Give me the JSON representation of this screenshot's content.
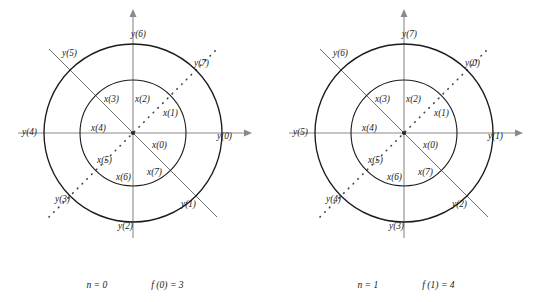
{
  "figure": {
    "background_color": "#ffffff",
    "stroke_color": "#1b1b1b",
    "axis_color": "#8a8a8a",
    "diagonal_solid_color": "#6f6f6f",
    "diagonal_dotted_color": "#4a4a4a"
  },
  "diagrams": [
    {
      "id": "left",
      "caption": {
        "n": "n = 0",
        "f": "f (0) = 3"
      },
      "outer_labels": [
        {
          "text": "y(0)",
          "angle_deg": 0,
          "x": 217,
          "y": 132
        },
        {
          "text": "y(1)",
          "angle_deg": 315,
          "x": 181,
          "y": 200
        },
        {
          "text": "y(2)",
          "angle_deg": 270,
          "x": 118,
          "y": 222
        },
        {
          "text": "y(3)",
          "angle_deg": 225,
          "x": 55,
          "y": 195
        },
        {
          "text": "y(4)",
          "angle_deg": 180,
          "x": 22,
          "y": 128
        },
        {
          "text": "y(5)",
          "angle_deg": 135,
          "x": 62,
          "y": 49
        },
        {
          "text": "y(6)",
          "angle_deg": 90,
          "x": 131,
          "y": 30
        },
        {
          "text": "y(7)",
          "angle_deg": 45,
          "x": 194,
          "y": 59
        }
      ],
      "inner_labels": [
        {
          "text": "x(0)",
          "angle_deg": 0,
          "x": 152,
          "y": 141
        },
        {
          "text": "x(1)",
          "angle_deg": 45,
          "x": 163,
          "y": 109
        },
        {
          "text": "x(2)",
          "angle_deg": 90,
          "x": 135,
          "y": 95
        },
        {
          "text": "x(3)",
          "angle_deg": 135,
          "x": 104,
          "y": 95
        },
        {
          "text": "x(4)",
          "angle_deg": 180,
          "x": 91,
          "y": 124
        },
        {
          "text": "x(5)",
          "angle_deg": 225,
          "x": 97,
          "y": 156
        },
        {
          "text": "x(6)",
          "angle_deg": 270,
          "x": 116,
          "y": 173
        },
        {
          "text": "x(7)",
          "angle_deg": 315,
          "x": 147,
          "y": 168
        }
      ]
    },
    {
      "id": "right",
      "caption": {
        "n": "n = 1",
        "f": "f (1) = 4"
      },
      "outer_labels": [
        {
          "text": "y(1)",
          "angle_deg": 0,
          "x": 217,
          "y": 132
        },
        {
          "text": "y(2)",
          "angle_deg": 315,
          "x": 181,
          "y": 200
        },
        {
          "text": "y(3)",
          "angle_deg": 270,
          "x": 118,
          "y": 222
        },
        {
          "text": "y(4)",
          "angle_deg": 225,
          "x": 55,
          "y": 195
        },
        {
          "text": "y(5)",
          "angle_deg": 180,
          "x": 22,
          "y": 128
        },
        {
          "text": "y(6)",
          "angle_deg": 135,
          "x": 62,
          "y": 49
        },
        {
          "text": "y(7)",
          "angle_deg": 90,
          "x": 131,
          "y": 30
        },
        {
          "text": "y(0)",
          "angle_deg": 45,
          "x": 194,
          "y": 59
        }
      ],
      "inner_labels": [
        {
          "text": "x(0)",
          "angle_deg": 0,
          "x": 152,
          "y": 141
        },
        {
          "text": "x(1)",
          "angle_deg": 45,
          "x": 163,
          "y": 109
        },
        {
          "text": "x(2)",
          "angle_deg": 90,
          "x": 135,
          "y": 95
        },
        {
          "text": "x(3)",
          "angle_deg": 135,
          "x": 104,
          "y": 95
        },
        {
          "text": "x(4)",
          "angle_deg": 180,
          "x": 91,
          "y": 124
        },
        {
          "text": "x(5)",
          "angle_deg": 225,
          "x": 97,
          "y": 156
        },
        {
          "text": "x(6)",
          "angle_deg": 270,
          "x": 116,
          "y": 173
        },
        {
          "text": "x(7)",
          "angle_deg": 315,
          "x": 147,
          "y": 168
        }
      ]
    }
  ],
  "geometry": {
    "center_x": 133,
    "center_y": 133,
    "outer_radius": 89,
    "inner_radius": 53,
    "axis_x_left": 18,
    "axis_x_right": 248,
    "axis_y_top": 12,
    "axis_y_bottom": 238,
    "diagonal_half_length": 118
  }
}
